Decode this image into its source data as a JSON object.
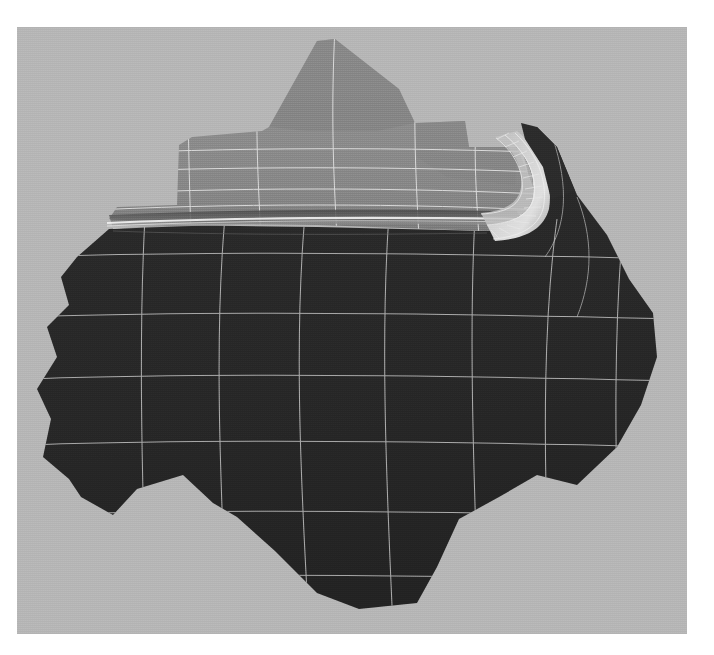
{
  "app": {
    "title": "3D Mesh Viewport",
    "subject": "filleted sheet part finite-element surface mesh",
    "render_mode": "shaded with wireframe overlay"
  },
  "viewport": {
    "name": "mesh-viewport",
    "x": 17,
    "y": 27,
    "width": 670,
    "height": 607,
    "page_background": "#ffffff",
    "background_color": "#b7b7b7"
  },
  "colors": {
    "page": "#ffffff",
    "canvas_gray": "#b7b7b7",
    "dark_face": "#282828",
    "dark_face_alt": "#2c2c2c",
    "mid_face": "#8e8e8e",
    "mid_face_light": "#9a9a9a",
    "mid_face_dark": "#7c7c7c",
    "shelf_step_dark": "#828282",
    "highlight": "#ededed",
    "wire_light": "#e6e6e6",
    "wire_on_dark": "#cfcfcf",
    "wire_on_mid": "#f0f0f0",
    "fillet_bright": "#e2e2e2"
  },
  "surfaces": [
    {
      "name": "upper-shelf-face",
      "shade": "#8e8e8e",
      "description": "raised light-gray shelf with stepped silhouette at top-left",
      "wire_color": "#f0f0f0"
    },
    {
      "name": "fillet-band",
      "shade": "#d8d8d8",
      "description": "curved corner fillet with dense radial mesh ribs, upper right of shelf",
      "rib_count": 22
    },
    {
      "name": "lower-plate-face",
      "shade": "#282828",
      "description": "large dark irregular polygonal plate occupying lower two-thirds",
      "wire_color": "#cfcfcf"
    }
  ],
  "mesh": {
    "dark_plate_columns": 6,
    "dark_plate_rows": 5,
    "shelf_columns": 5,
    "shelf_rows": 3,
    "line_width_px": 1,
    "element_type": "quadrilateral"
  },
  "chart_data": {
    "type": "heatmap",
    "title": "",
    "xlabel": "",
    "ylabel": "",
    "categories": [
      "c1",
      "c2",
      "c3",
      "c4",
      "c5",
      "c6"
    ],
    "series": [
      {
        "name": "upper-shelf-shade",
        "values": [
          142,
          142,
          140,
          139,
          137,
          136
        ]
      },
      {
        "name": "lower-plate-shade",
        "values": [
          40,
          40,
          40,
          40,
          40,
          40
        ]
      }
    ],
    "legend": [],
    "grid": true
  }
}
